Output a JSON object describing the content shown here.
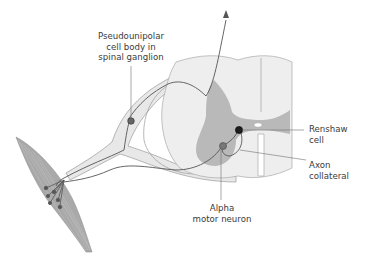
{
  "figure": {
    "labels": {
      "pseudounipolar": {
        "lines": [
          "Pseudounipolar",
          "cell body in",
          "spinal ganglion"
        ]
      },
      "renshaw": {
        "lines": [
          "Renshaw",
          "cell"
        ]
      },
      "axon_collateral": {
        "lines": [
          "Axon",
          "collateral"
        ]
      },
      "alpha_motor": {
        "lines": [
          "Alpha",
          "motor neuron"
        ]
      }
    },
    "colors": {
      "white_matter": "#eeeeee",
      "gray_matter": "#b9b9b9",
      "nerve_fill": "#e9e9e9",
      "outline": "#9a9a9a",
      "muscle": "#a8a8a8",
      "axon": "#555555",
      "cell": "#555555",
      "renshaw_cell": "#222222",
      "leader_line": "#707070"
    }
  }
}
